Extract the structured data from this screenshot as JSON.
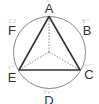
{
  "diagram": {
    "points": [
      {
        "label": "A",
        "ruby": "エー"
      },
      {
        "label": "B",
        "ruby": "ビー"
      },
      {
        "label": "C",
        "ruby": "シー"
      },
      {
        "label": "D",
        "ruby": "ディー"
      },
      {
        "label": "E",
        "ruby": "イー"
      },
      {
        "label": "F",
        "ruby": "エフ"
      }
    ],
    "colors": {
      "circle": "#555555",
      "triangle": "#333333",
      "dashed": "#555555"
    }
  }
}
